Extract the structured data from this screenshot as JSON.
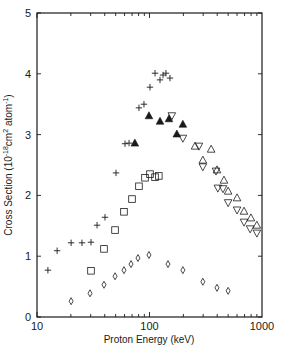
{
  "chart_data": {
    "type": "scatter",
    "title": "",
    "xlabel": "Proton Energy (keV)",
    "ylabel": "Cross Section (10^-18 cm^2 atom^-1)",
    "ylabel_parts": {
      "main": "Cross Section (10",
      "exp1": "-18",
      "mid": "cm",
      "exp2": "2",
      "tail": " atom",
      "exp3": "-1",
      "close": ")"
    },
    "xscale": "log",
    "xlim": [
      10,
      1000
    ],
    "ylim": [
      0,
      5
    ],
    "grid": false,
    "legend": "none",
    "x_tick_labels": [
      "10",
      "100",
      "1000"
    ],
    "y_tick_labels": [
      "0",
      "1",
      "2",
      "3",
      "4",
      "5"
    ],
    "series": [
      {
        "name": "plus",
        "marker": "plus",
        "x": [
          12.5,
          15.1,
          20.1,
          25.1,
          30.2,
          34.2,
          40.2,
          50.4,
          60.6,
          65.8,
          80.6,
          89.3,
          101,
          112,
          124,
          132,
          140,
          152
        ],
        "y": [
          0.77,
          1.09,
          1.22,
          1.22,
          1.23,
          1.51,
          1.64,
          2.37,
          2.85,
          2.86,
          3.44,
          3.5,
          3.78,
          4.01,
          3.9,
          3.98,
          4.01,
          3.93
        ]
      },
      {
        "name": "filled-triangle",
        "marker": "triangle-up-filled",
        "x": [
          74.1,
          98.9,
          124,
          149,
          175,
          198
        ],
        "y": [
          2.86,
          3.31,
          3.22,
          3.26,
          3.01,
          3.17
        ]
      },
      {
        "name": "open-triangle-up",
        "marker": "triangle-up-open",
        "x": [
          254,
          298,
          353,
          398,
          459,
          500,
          600,
          692,
          797,
          900
        ],
        "y": [
          2.81,
          2.58,
          2.76,
          2.42,
          2.25,
          2.07,
          1.96,
          1.74,
          1.63,
          1.51
        ]
      },
      {
        "name": "open-triangle-down",
        "marker": "triangle-down-open",
        "x": [
          158,
          198,
          275,
          298,
          390,
          405,
          450,
          500,
          600,
          692,
          784,
          900
        ],
        "y": [
          3.31,
          2.94,
          2.81,
          2.47,
          2.4,
          2.12,
          2.11,
          1.88,
          1.76,
          1.56,
          1.45,
          1.38
        ]
      },
      {
        "name": "open-square",
        "marker": "square-open",
        "x": [
          30.2,
          39.4,
          49.4,
          59.3,
          69.9,
          80.6,
          91.2,
          101,
          112,
          121
        ],
        "y": [
          0.76,
          1.12,
          1.43,
          1.73,
          1.94,
          2.15,
          2.29,
          2.35,
          2.3,
          2.32
        ]
      },
      {
        "name": "open-diamond",
        "marker": "diamond-open",
        "x": [
          20.1,
          29.6,
          39.4,
          49.4,
          59.3,
          68.5,
          79.0,
          98.9,
          146,
          198,
          298,
          398,
          500
        ],
        "y": [
          0.26,
          0.39,
          0.53,
          0.67,
          0.77,
          0.87,
          0.97,
          1.02,
          0.87,
          0.77,
          0.58,
          0.48,
          0.43
        ]
      }
    ]
  },
  "style": {
    "ink": "#1a1a1a",
    "background": "#ffffff"
  }
}
